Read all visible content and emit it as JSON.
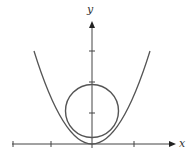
{
  "figure": {
    "x_axis_label": "x",
    "y_axis_label": "y",
    "colors": {
      "stroke": "#555555",
      "axis": "#444444",
      "background": "#ffffff"
    }
  },
  "curves": {
    "parabola": {
      "type": "parabola",
      "vertex": [
        0,
        0
      ]
    },
    "circle": {
      "type": "circle",
      "note": "circle sits inside the parabola, touching it on both sides"
    }
  },
  "axes": {
    "x_ticks": 4,
    "y_ticks": 3
  }
}
